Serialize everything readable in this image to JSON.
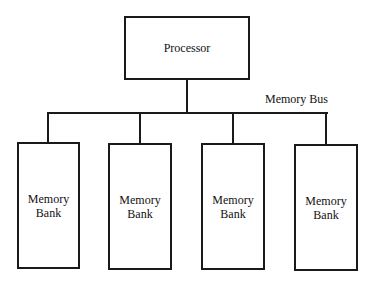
{
  "diagram": {
    "processor": {
      "label": "Processor"
    },
    "bus": {
      "label": "Memory Bus"
    },
    "banks": [
      {
        "line1": "Memory",
        "line2": "Bank"
      },
      {
        "line1": "Memory",
        "line2": "Bank"
      },
      {
        "line1": "Memory",
        "line2": "Bank"
      },
      {
        "line1": "Memory",
        "line2": "Bank"
      }
    ]
  }
}
